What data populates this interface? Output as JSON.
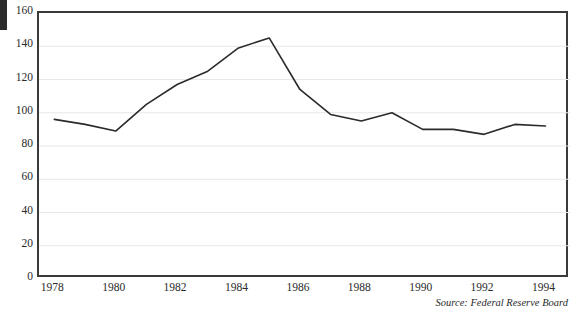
{
  "figure": {
    "edge_mark": "page-edge-artifact",
    "title_partial": "continued"
  },
  "source": {
    "text": "Source: Federal Reserve Board"
  },
  "axis": {
    "y_ticks": [
      "0",
      "20",
      "40",
      "60",
      "80",
      "100",
      "120",
      "140",
      "160"
    ],
    "x_ticks": [
      "1978",
      "1980",
      "1982",
      "1984",
      "1986",
      "1988",
      "1990",
      "1992",
      "1994"
    ]
  },
  "colors": {
    "line": "#2b2b2b",
    "frame": "#3a3a3a",
    "grid": "#e8e8e8",
    "background": "#ffffff"
  },
  "chart_data": {
    "type": "line",
    "title": "",
    "xlabel": "",
    "ylabel": "",
    "xlim": [
      1977.5,
      1994.8
    ],
    "ylim": [
      0,
      160
    ],
    "grid": true,
    "legend": "none",
    "x": [
      1978,
      1979,
      1980,
      1981,
      1982,
      1983,
      1984,
      1985,
      1986,
      1987,
      1988,
      1989,
      1990,
      1991,
      1992,
      1993,
      1994
    ],
    "series": [
      {
        "name": "index",
        "values": [
          96,
          93,
          89,
          105,
          117,
          125,
          139,
          145,
          114,
          99,
          95,
          100,
          90,
          90,
          87,
          93,
          92
        ]
      }
    ],
    "x_tick_values": [
      1978,
      1980,
      1982,
      1984,
      1986,
      1988,
      1990,
      1992,
      1994
    ],
    "y_tick_values": [
      0,
      20,
      40,
      60,
      80,
      100,
      120,
      140,
      160
    ],
    "annotations": [
      "Source: Federal Reserve Board"
    ]
  }
}
